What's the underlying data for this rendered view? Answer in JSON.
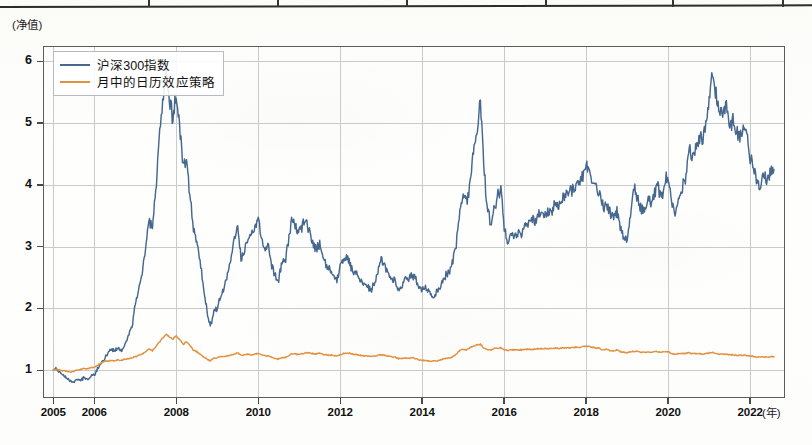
{
  "page": {
    "background_color": "#fdfdfb",
    "table_fragment": {
      "name": "cropped-table-bottom-border",
      "separator_x": [
        148,
        277,
        406,
        545,
        672,
        782
      ]
    }
  },
  "chart_data": {
    "type": "line",
    "title": "",
    "subtitle": "",
    "xlabel": "(年)",
    "ylabel": "(净值)",
    "grid": true,
    "legend_position": "top-left",
    "xlim": [
      2004.75,
      2022.85
    ],
    "ylim": [
      0.55,
      6.25
    ],
    "yticks": [
      1,
      2,
      3,
      4,
      5,
      6
    ],
    "ytick_labels": [
      "1",
      "2",
      "3",
      "4",
      "5",
      "6"
    ],
    "xticks": [
      2005,
      2006,
      2008,
      2010,
      2012,
      2014,
      2016,
      2018,
      2020,
      2022
    ],
    "xtick_labels": [
      "2005",
      "2006",
      "2008",
      "2010",
      "2012",
      "2014",
      "2016",
      "2018",
      "2020",
      "2022"
    ],
    "colors": {
      "series_1": "#46688f",
      "series_2": "#e1913f",
      "grid": "#b3b3b3",
      "axis": "#5c5c5c",
      "text": "#111111"
    },
    "series": [
      {
        "name": "沪深300指数",
        "color": "#46688f",
        "x": [
          2005.0,
          2005.08,
          2005.17,
          2005.25,
          2005.33,
          2005.42,
          2005.5,
          2005.58,
          2005.67,
          2005.75,
          2005.83,
          2005.92,
          2006.0,
          2006.08,
          2006.17,
          2006.25,
          2006.33,
          2006.42,
          2006.5,
          2006.58,
          2006.67,
          2006.75,
          2006.83,
          2006.92,
          2007.0,
          2007.08,
          2007.17,
          2007.25,
          2007.33,
          2007.42,
          2007.5,
          2007.58,
          2007.67,
          2007.75,
          2007.83,
          2007.92,
          2008.0,
          2008.08,
          2008.17,
          2008.25,
          2008.33,
          2008.42,
          2008.5,
          2008.58,
          2008.67,
          2008.75,
          2008.83,
          2008.92,
          2009.0,
          2009.08,
          2009.17,
          2009.25,
          2009.33,
          2009.42,
          2009.5,
          2009.58,
          2009.67,
          2009.75,
          2009.83,
          2009.92,
          2010.0,
          2010.08,
          2010.17,
          2010.25,
          2010.33,
          2010.42,
          2010.5,
          2010.58,
          2010.67,
          2010.75,
          2010.83,
          2010.92,
          2011.0,
          2011.08,
          2011.17,
          2011.25,
          2011.33,
          2011.42,
          2011.5,
          2011.58,
          2011.67,
          2011.75,
          2011.83,
          2011.92,
          2012.0,
          2012.08,
          2012.17,
          2012.25,
          2012.33,
          2012.42,
          2012.5,
          2012.58,
          2012.67,
          2012.75,
          2012.83,
          2012.92,
          2013.0,
          2013.08,
          2013.17,
          2013.25,
          2013.33,
          2013.42,
          2013.5,
          2013.58,
          2013.67,
          2013.75,
          2013.83,
          2013.92,
          2014.0,
          2014.08,
          2014.17,
          2014.25,
          2014.33,
          2014.42,
          2014.5,
          2014.58,
          2014.67,
          2014.75,
          2014.83,
          2014.92,
          2015.0,
          2015.08,
          2015.17,
          2015.25,
          2015.33,
          2015.42,
          2015.5,
          2015.58,
          2015.67,
          2015.75,
          2015.83,
          2015.92,
          2016.0,
          2016.08,
          2016.17,
          2016.25,
          2016.33,
          2016.42,
          2016.5,
          2016.58,
          2016.67,
          2016.75,
          2016.83,
          2016.92,
          2017.0,
          2017.08,
          2017.17,
          2017.25,
          2017.33,
          2017.42,
          2017.5,
          2017.58,
          2017.67,
          2017.75,
          2017.83,
          2017.92,
          2018.0,
          2018.08,
          2018.17,
          2018.25,
          2018.33,
          2018.42,
          2018.5,
          2018.58,
          2018.67,
          2018.75,
          2018.83,
          2018.92,
          2019.0,
          2019.08,
          2019.17,
          2019.25,
          2019.33,
          2019.42,
          2019.5,
          2019.58,
          2019.67,
          2019.75,
          2019.83,
          2019.92,
          2020.0,
          2020.08,
          2020.17,
          2020.25,
          2020.33,
          2020.42,
          2020.5,
          2020.58,
          2020.67,
          2020.75,
          2020.83,
          2020.92,
          2021.0,
          2021.08,
          2021.17,
          2021.25,
          2021.33,
          2021.42,
          2021.5,
          2021.58,
          2021.67,
          2021.75,
          2021.83,
          2021.92,
          2022.0,
          2022.08,
          2022.17,
          2022.25,
          2022.33,
          2022.42,
          2022.5,
          2022.58
        ],
        "y": [
          1.0,
          1.02,
          0.96,
          0.92,
          0.88,
          0.83,
          0.8,
          0.86,
          0.83,
          0.88,
          0.85,
          0.9,
          0.92,
          1.02,
          1.12,
          1.18,
          1.28,
          1.35,
          1.3,
          1.36,
          1.32,
          1.42,
          1.55,
          1.7,
          2.05,
          2.3,
          2.55,
          2.95,
          3.45,
          3.3,
          3.95,
          4.65,
          5.3,
          5.85,
          5.35,
          5.1,
          5.45,
          5.0,
          4.25,
          4.45,
          3.85,
          3.3,
          3.1,
          2.75,
          2.35,
          1.95,
          1.7,
          1.95,
          2.0,
          2.2,
          2.35,
          2.55,
          2.8,
          3.1,
          3.35,
          2.8,
          2.95,
          3.15,
          3.2,
          3.35,
          3.45,
          3.15,
          2.95,
          3.05,
          2.7,
          2.55,
          2.45,
          2.75,
          2.8,
          3.15,
          3.45,
          3.3,
          3.25,
          3.35,
          3.4,
          3.25,
          3.05,
          2.95,
          3.05,
          2.85,
          2.7,
          2.6,
          2.55,
          2.45,
          2.7,
          2.8,
          2.85,
          2.7,
          2.6,
          2.55,
          2.45,
          2.4,
          2.35,
          2.3,
          2.4,
          2.6,
          2.8,
          2.7,
          2.6,
          2.5,
          2.45,
          2.3,
          2.35,
          2.5,
          2.45,
          2.55,
          2.5,
          2.35,
          2.3,
          2.35,
          2.25,
          2.2,
          2.25,
          2.3,
          2.45,
          2.55,
          2.6,
          2.75,
          3.05,
          3.55,
          3.8,
          3.7,
          4.05,
          4.55,
          4.85,
          5.4,
          4.35,
          3.7,
          3.35,
          3.6,
          3.8,
          3.95,
          3.35,
          3.05,
          3.25,
          3.2,
          3.25,
          3.2,
          3.35,
          3.4,
          3.45,
          3.4,
          3.5,
          3.55,
          3.5,
          3.55,
          3.6,
          3.7,
          3.65,
          3.8,
          3.85,
          3.9,
          3.95,
          4.0,
          4.05,
          4.15,
          4.35,
          4.2,
          4.05,
          3.95,
          3.85,
          3.65,
          3.7,
          3.55,
          3.45,
          3.6,
          3.3,
          3.15,
          3.1,
          3.55,
          3.95,
          3.8,
          3.6,
          3.55,
          3.75,
          3.7,
          3.85,
          3.95,
          3.8,
          4.05,
          4.15,
          3.8,
          3.55,
          3.75,
          3.95,
          4.1,
          4.55,
          4.5,
          4.6,
          4.75,
          4.7,
          4.95,
          5.35,
          5.85,
          5.45,
          5.2,
          5.15,
          5.35,
          5.05,
          5.0,
          4.85,
          4.8,
          4.95,
          4.85,
          4.45,
          4.3,
          4.05,
          3.95,
          4.25,
          4.05,
          4.2,
          4.25
        ]
      },
      {
        "name": "月中的日历效应策略",
        "color": "#e1913f",
        "x": [
          2005.0,
          2005.08,
          2005.17,
          2005.25,
          2005.33,
          2005.42,
          2005.5,
          2005.58,
          2005.67,
          2005.75,
          2005.83,
          2005.92,
          2006.0,
          2006.08,
          2006.17,
          2006.25,
          2006.33,
          2006.42,
          2006.5,
          2006.58,
          2006.67,
          2006.75,
          2006.83,
          2006.92,
          2007.0,
          2007.08,
          2007.17,
          2007.25,
          2007.33,
          2007.42,
          2007.5,
          2007.58,
          2007.67,
          2007.75,
          2007.83,
          2007.92,
          2008.0,
          2008.08,
          2008.17,
          2008.25,
          2008.33,
          2008.42,
          2008.5,
          2008.58,
          2008.67,
          2008.75,
          2008.83,
          2008.92,
          2009.0,
          2009.08,
          2009.17,
          2009.25,
          2009.33,
          2009.42,
          2009.5,
          2009.58,
          2009.67,
          2009.75,
          2009.83,
          2009.92,
          2010.0,
          2010.08,
          2010.17,
          2010.25,
          2010.33,
          2010.42,
          2010.5,
          2010.58,
          2010.67,
          2010.75,
          2010.83,
          2010.92,
          2011.0,
          2011.08,
          2011.17,
          2011.25,
          2011.33,
          2011.42,
          2011.5,
          2011.58,
          2011.67,
          2011.75,
          2011.83,
          2011.92,
          2012.0,
          2012.08,
          2012.17,
          2012.25,
          2012.33,
          2012.42,
          2012.5,
          2012.58,
          2012.67,
          2012.75,
          2012.83,
          2012.92,
          2013.0,
          2013.08,
          2013.17,
          2013.25,
          2013.33,
          2013.42,
          2013.5,
          2013.58,
          2013.67,
          2013.75,
          2013.83,
          2013.92,
          2014.0,
          2014.08,
          2014.17,
          2014.25,
          2014.33,
          2014.42,
          2014.5,
          2014.58,
          2014.67,
          2014.75,
          2014.83,
          2014.92,
          2015.0,
          2015.08,
          2015.17,
          2015.25,
          2015.33,
          2015.42,
          2015.5,
          2015.58,
          2015.67,
          2015.75,
          2015.83,
          2015.92,
          2016.0,
          2016.08,
          2016.17,
          2016.25,
          2016.33,
          2016.42,
          2016.5,
          2016.58,
          2016.67,
          2016.75,
          2016.83,
          2016.92,
          2017.0,
          2017.08,
          2017.17,
          2017.25,
          2017.33,
          2017.42,
          2017.5,
          2017.58,
          2017.67,
          2017.75,
          2017.83,
          2017.92,
          2018.0,
          2018.08,
          2018.17,
          2018.25,
          2018.33,
          2018.42,
          2018.5,
          2018.58,
          2018.67,
          2018.75,
          2018.83,
          2018.92,
          2019.0,
          2019.08,
          2019.17,
          2019.25,
          2019.33,
          2019.42,
          2019.5,
          2019.58,
          2019.67,
          2019.75,
          2019.83,
          2019.92,
          2020.0,
          2020.08,
          2020.17,
          2020.25,
          2020.33,
          2020.42,
          2020.5,
          2020.58,
          2020.67,
          2020.75,
          2020.83,
          2020.92,
          2021.0,
          2021.08,
          2021.17,
          2021.25,
          2021.33,
          2021.42,
          2021.5,
          2021.58,
          2021.67,
          2021.75,
          2021.83,
          2021.92,
          2022.0,
          2022.08,
          2022.17,
          2022.25,
          2022.33,
          2022.42,
          2022.5,
          2022.58
        ],
        "y": [
          1.0,
          1.02,
          1.0,
          0.99,
          0.98,
          0.97,
          0.98,
          1.0,
          1.01,
          1.03,
          1.02,
          1.04,
          1.05,
          1.08,
          1.12,
          1.14,
          1.15,
          1.16,
          1.15,
          1.17,
          1.16,
          1.18,
          1.19,
          1.2,
          1.22,
          1.24,
          1.26,
          1.3,
          1.34,
          1.32,
          1.38,
          1.45,
          1.52,
          1.58,
          1.54,
          1.5,
          1.56,
          1.5,
          1.42,
          1.46,
          1.4,
          1.33,
          1.3,
          1.26,
          1.22,
          1.18,
          1.15,
          1.2,
          1.2,
          1.22,
          1.22,
          1.23,
          1.24,
          1.26,
          1.28,
          1.24,
          1.25,
          1.26,
          1.25,
          1.26,
          1.27,
          1.25,
          1.23,
          1.24,
          1.21,
          1.19,
          1.18,
          1.2,
          1.21,
          1.24,
          1.27,
          1.26,
          1.26,
          1.27,
          1.28,
          1.28,
          1.27,
          1.27,
          1.28,
          1.26,
          1.25,
          1.24,
          1.24,
          1.23,
          1.25,
          1.27,
          1.28,
          1.27,
          1.26,
          1.25,
          1.24,
          1.23,
          1.23,
          1.22,
          1.23,
          1.24,
          1.25,
          1.24,
          1.23,
          1.22,
          1.21,
          1.19,
          1.19,
          1.2,
          1.19,
          1.2,
          1.19,
          1.17,
          1.16,
          1.16,
          1.15,
          1.15,
          1.15,
          1.16,
          1.18,
          1.19,
          1.2,
          1.22,
          1.26,
          1.32,
          1.34,
          1.33,
          1.36,
          1.39,
          1.41,
          1.42,
          1.36,
          1.34,
          1.33,
          1.35,
          1.36,
          1.36,
          1.33,
          1.32,
          1.33,
          1.33,
          1.33,
          1.33,
          1.34,
          1.34,
          1.34,
          1.34,
          1.35,
          1.35,
          1.35,
          1.35,
          1.35,
          1.36,
          1.35,
          1.36,
          1.36,
          1.36,
          1.37,
          1.37,
          1.37,
          1.38,
          1.39,
          1.38,
          1.37,
          1.36,
          1.35,
          1.33,
          1.34,
          1.32,
          1.31,
          1.33,
          1.3,
          1.29,
          1.28,
          1.3,
          1.31,
          1.3,
          1.29,
          1.29,
          1.3,
          1.29,
          1.3,
          1.3,
          1.29,
          1.3,
          1.3,
          1.27,
          1.26,
          1.27,
          1.27,
          1.27,
          1.28,
          1.27,
          1.27,
          1.27,
          1.26,
          1.27,
          1.28,
          1.29,
          1.27,
          1.26,
          1.26,
          1.26,
          1.25,
          1.25,
          1.24,
          1.24,
          1.24,
          1.24,
          1.23,
          1.22,
          1.21,
          1.21,
          1.22,
          1.21,
          1.22,
          1.22
        ]
      }
    ]
  },
  "legend": {
    "items": [
      {
        "label": "沪深300指数",
        "color": "#46688f"
      },
      {
        "label": "月中的日历效应策略",
        "color": "#e1913f"
      }
    ]
  }
}
